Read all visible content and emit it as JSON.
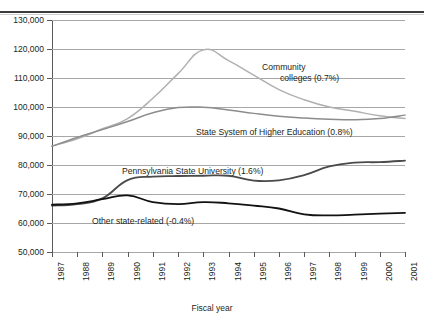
{
  "figure": {
    "top_fragment": "",
    "axis_title_x": "Fiscal year"
  },
  "chart_data": {
    "type": "line",
    "title": "",
    "xlabel": "Fiscal year",
    "ylabel": "",
    "grid": true,
    "legend": "inline-labels",
    "ylim": [
      50000,
      130000
    ],
    "ytick_labels": [
      "130,000",
      "120,000",
      "110,000",
      "100,000",
      "90,000",
      "80,000",
      "70,000",
      "60,000",
      "50,000"
    ],
    "ytick_values": [
      130000,
      120000,
      110000,
      100000,
      90000,
      80000,
      70000,
      60000,
      50000
    ],
    "categories": [
      "1987",
      "1988",
      "1989",
      "1990",
      "1991",
      "1992",
      "1993",
      "1994",
      "1995",
      "1996",
      "1997",
      "1998",
      "1999",
      "2000",
      "2001"
    ],
    "x": [
      1987,
      1988,
      1989,
      1990,
      1991,
      1992,
      1993,
      1994,
      1995,
      1996,
      1997,
      1998,
      1999,
      2000,
      2001
    ],
    "series": [
      {
        "name": "Community colleges (0.7%)",
        "label": "Community colleges (0.7%)",
        "label_line1": "Community",
        "label_line2": "colleges (0.7%)",
        "annotation": "0.7%",
        "color": "#b0b0b0",
        "values": [
          86500,
          89000,
          92500,
          96000,
          103000,
          111500,
          119700,
          116000,
          111000,
          106000,
          102500,
          100000,
          98500,
          97000,
          96000
        ]
      },
      {
        "name": "State System of Higher Education (0.8%)",
        "label": "State System of Higher Education (0.8%)",
        "annotation": "0.8%",
        "color": "#8c8c8c",
        "values": [
          86500,
          89500,
          92200,
          95000,
          98000,
          99800,
          99900,
          99000,
          97800,
          96800,
          96200,
          95800,
          95600,
          96000,
          97200
        ]
      },
      {
        "name": "Pennsylvania State University (1.6%)",
        "label": "Pennsylvania State University (1.6%)",
        "annotation": "1.6%",
        "color": "#4a4a4a",
        "values": [
          66000,
          66500,
          68500,
          74800,
          76000,
          76200,
          76300,
          76300,
          74600,
          74700,
          76500,
          79500,
          80800,
          81000,
          81500
        ]
      },
      {
        "name": "Other state-related (-0.4%)",
        "label": "Other state-related (-0.4%)",
        "annotation": "-0.4%",
        "color": "#121212",
        "values": [
          66300,
          66800,
          68200,
          69500,
          67200,
          66500,
          67200,
          66800,
          66000,
          65000,
          63000,
          62600,
          62900,
          63200,
          63500
        ]
      }
    ]
  }
}
